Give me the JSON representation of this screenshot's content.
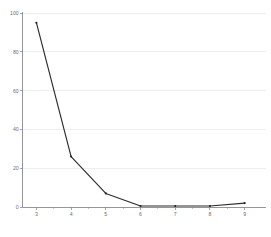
{
  "chart_data": {
    "type": "line",
    "title": "",
    "subtitle": "",
    "xlabel": "",
    "ylabel": "",
    "x": [
      3,
      4,
      5,
      6,
      7,
      8,
      9
    ],
    "values": [
      95,
      26,
      7,
      0.5,
      0.5,
      0.5,
      2
    ],
    "series": [
      {
        "name": "",
        "values": [
          95,
          26,
          7,
          0.5,
          0.5,
          0.5,
          2
        ],
        "color": "#2b2b2b"
      }
    ],
    "categories": [
      "3",
      "4",
      "5",
      "6",
      "7",
      "8",
      "9"
    ],
    "xlim": [
      2.6,
      9.6
    ],
    "ylim": [
      0,
      100
    ],
    "x_ticks": [
      3,
      4,
      5,
      6,
      7,
      8,
      9
    ],
    "x_tick_labels": [
      "3",
      "4",
      "5",
      "6",
      "7",
      "8",
      "9"
    ],
    "x_minor_ticks": [
      3.5,
      4.5,
      5.5,
      6.5,
      7.5,
      8.5
    ],
    "y_ticks": [
      0,
      20,
      40,
      60,
      80,
      100
    ],
    "y_tick_labels": [
      "0",
      "20",
      "40",
      "60",
      "80",
      "100"
    ],
    "grid": "horizontal",
    "legend": "none",
    "markers": true,
    "annotations": []
  },
  "axes": {
    "grid_color": "#e9e9ef",
    "axis_color": "#8a8a90",
    "tick_label_color": "#6e6e6e",
    "background": "#ffffff"
  }
}
